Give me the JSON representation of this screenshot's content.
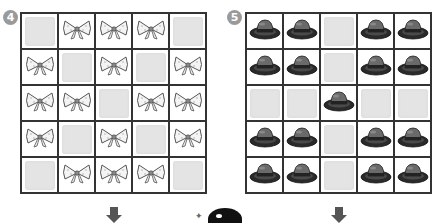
{
  "puzzles": [
    {
      "number": "4",
      "item": "bow",
      "grid": [
        [
          "blank",
          "bow",
          "bow",
          "bow",
          "blank"
        ],
        [
          "bow",
          "blank",
          "bow",
          "blank",
          "bow"
        ],
        [
          "bow",
          "bow",
          "blank",
          "bow",
          "bow"
        ],
        [
          "bow",
          "blank",
          "bow",
          "blank",
          "bow"
        ],
        [
          "blank",
          "bow",
          "bow",
          "bow",
          "blank"
        ]
      ]
    },
    {
      "number": "5",
      "item": "hat",
      "grid": [
        [
          "hat",
          "hat",
          "blank",
          "hat",
          "hat"
        ],
        [
          "hat",
          "hat",
          "blank",
          "hat",
          "hat"
        ],
        [
          "blank",
          "blank",
          "hat",
          "blank",
          "blank"
        ],
        [
          "hat",
          "hat",
          "blank",
          "hat",
          "hat"
        ],
        [
          "hat",
          "hat",
          "blank",
          "hat",
          "hat"
        ]
      ]
    }
  ],
  "colors": {
    "badge": "#9a9a9a",
    "grid_line": "#333333",
    "blank_tile": "#e4e4e4",
    "hat": "#444444",
    "bow_outline": "#555555"
  },
  "icons": {
    "bow": "bow-icon",
    "hat": "hat-icon",
    "arrow": "arrow-down-icon",
    "mascot": "mascot-icon"
  }
}
